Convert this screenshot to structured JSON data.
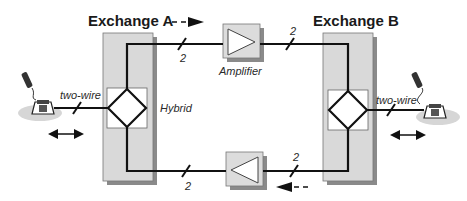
{
  "diagram": {
    "exchange_a": {
      "title": "Exchange A",
      "hybrid_label": "Hybrid"
    },
    "exchange_b": {
      "title": "Exchange B"
    },
    "amplifier_top": {
      "label": "Amplifier"
    },
    "left_line": {
      "label": "two-wire"
    },
    "right_line": {
      "label": "two-wire"
    },
    "wire_counts": {
      "top_left": "2",
      "top_right": "2",
      "bottom_left": "2",
      "bottom_right": "2"
    },
    "icons": {
      "left_phone": "telephone-icon",
      "right_phone": "telephone-icon",
      "direction_top": "dashed-arrow-right-icon",
      "direction_bottom": "dashed-arrow-left-icon",
      "bidirectional_left": "double-arrow-icon",
      "bidirectional_right": "double-arrow-icon"
    },
    "colors": {
      "exchange_fill": "#d9d9d9",
      "shadow": "#8a8a8a",
      "amplifier_fill": "#dcdcdc",
      "phone_shadow": "#d6d6d6",
      "line": "#111111"
    }
  }
}
